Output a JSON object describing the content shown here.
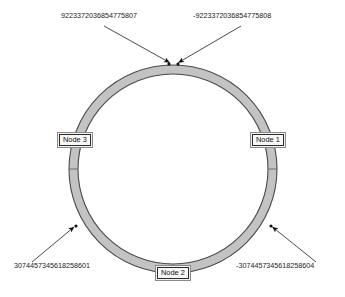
{
  "diagram": {
    "type": "consistent-hashing-ring",
    "canvas": {
      "width": 345,
      "height": 297
    },
    "ring": {
      "center_x": 173,
      "center_y": 169,
      "outer_radius": 104,
      "inner_radius": 95,
      "fill_color": "#c3c3c3",
      "stroke_color": "#4a4a4a",
      "inner_fill_color": "#ffffff"
    },
    "nodes": [
      {
        "id": "node-1",
        "label": "Node 1",
        "angle_deg": 0,
        "position": "right"
      },
      {
        "id": "node-2",
        "label": "Node 2",
        "angle_deg": 90,
        "position": "bottom"
      },
      {
        "id": "node-3",
        "label": "Node 3",
        "angle_deg": 180,
        "position": "left"
      }
    ],
    "annotations": [
      {
        "id": "hash-max-positive",
        "value": "9223372036854775807",
        "side": "top-left",
        "target_angle_deg": 268,
        "leader_color": "#2b2b2b"
      },
      {
        "id": "hash-min-negative",
        "value": "-9223372036854775808",
        "side": "top-right",
        "target_angle_deg": 272,
        "leader_color": "#2b2b2b"
      },
      {
        "id": "hash-third-positive",
        "value": "3074457345618258601",
        "side": "bottom-left",
        "target_angle_deg": 148,
        "leader_color": "#2b2b2b"
      },
      {
        "id": "hash-third-negative",
        "value": "-3074457345618258604",
        "side": "bottom-right",
        "target_angle_deg": 32,
        "leader_color": "#2b2b2b"
      }
    ]
  }
}
